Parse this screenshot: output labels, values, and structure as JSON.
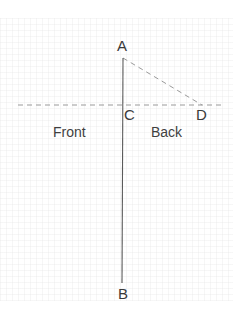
{
  "figure": {
    "background_color": "#ffffff",
    "stroke_color": "#4a4a4a",
    "dash_color": "#8d8d8d",
    "text_color": "#3a3a3a"
  },
  "points": {
    "A": {
      "label": "A",
      "x": 123,
      "y": 58
    },
    "B": {
      "label": "B",
      "x": 122,
      "y": 283
    },
    "C": {
      "label": "C",
      "x": 123,
      "y": 105
    },
    "D": {
      "label": "D",
      "x": 202,
      "y": 105
    }
  },
  "regions": {
    "front": {
      "label": "Front"
    },
    "back": {
      "label": "Back"
    }
  },
  "segments": {
    "AB": {
      "name": "vertical-line-AB",
      "style": "solid",
      "x1": 123,
      "y1": 58,
      "x2": 122,
      "y2": 283
    },
    "AD": {
      "name": "diagonal-dashed-line-AD",
      "style": "dashed",
      "x1": 123,
      "y1": 58,
      "x2": 202,
      "y2": 105
    },
    "horizon": {
      "name": "horizontal-dashed-line",
      "style": "dashed",
      "x1": 18,
      "y1": 105,
      "x2": 222,
      "y2": 105
    }
  }
}
